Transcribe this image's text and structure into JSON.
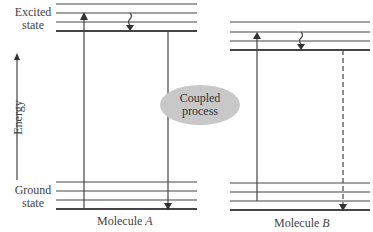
{
  "diagram": {
    "axis": {
      "label": "Energy",
      "direction": "up"
    },
    "labels": {
      "excited": "Excited\nstate",
      "excited_line1": "Excited",
      "excited_line2": "state",
      "ground_line1": "Ground",
      "ground_line2": "state"
    },
    "coupling": {
      "line1": "Coupled",
      "line2": "process",
      "fill": "#c8c8c8"
    },
    "molecules": [
      {
        "name": "Molecule",
        "letter": "A",
        "excited_levels": 4,
        "ground_levels": 4,
        "transitions": [
          "absorption (up arrow, solid)",
          "vibrational relaxation (wavy, down)",
          "emission (down arrow, solid)"
        ]
      },
      {
        "name": "Molecule",
        "letter": "B",
        "excited_levels": 4,
        "ground_levels": 4,
        "transitions": [
          "absorption (up arrow, solid)",
          "vibrational relaxation (wavy, down)",
          "transition (down arrow, dashed)"
        ]
      }
    ],
    "line_color": "#444444"
  }
}
